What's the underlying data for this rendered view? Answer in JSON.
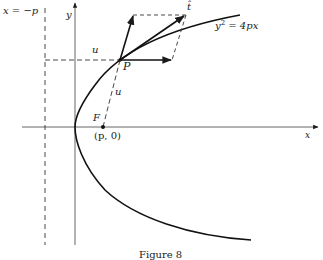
{
  "figure": {
    "caption": "Figure 8",
    "labels": {
      "directrix": "x = −p",
      "y_axis": "y",
      "x_axis": "x",
      "curve_lhs": "y",
      "curve_exp": "2",
      "curve_rhs": " = 4px",
      "point": "P",
      "focus": "F",
      "focus_coords": "(p, 0)",
      "tangent": "t̂",
      "u_horizontal": "u",
      "u_focal": "u"
    },
    "colors": {
      "ink": "#1a1a1a",
      "dash": "#333333",
      "background": "#ffffff"
    }
  }
}
